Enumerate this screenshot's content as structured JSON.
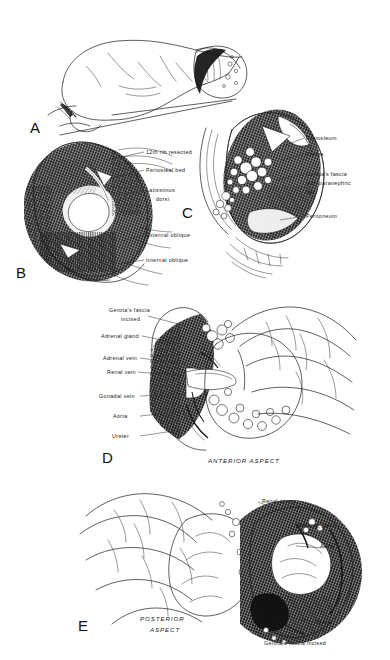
{
  "figure": {
    "ink_color": "#1a1a1a",
    "background_color": "#ffffff"
  },
  "panels": [
    {
      "letter": "A",
      "name": "patient-positioning",
      "caption": "",
      "labels": []
    },
    {
      "letter": "B",
      "name": "superficial-muscle-layers",
      "caption": "",
      "labels": [
        {
          "text": "12th rib resected"
        },
        {
          "text": "Periosteal bed"
        },
        {
          "text": "Latissimus"
        },
        {
          "text": "dorsi"
        },
        {
          "text": "External oblique"
        },
        {
          "text": "Internal oblique"
        }
      ]
    },
    {
      "letter": "C",
      "name": "deep-retroperitoneal-exposure",
      "caption": "",
      "labels": [
        {
          "text": "Periosteum"
        },
        {
          "text": "Pleura"
        },
        {
          "text": "Gerota's fascia"
        },
        {
          "text": "with paranephric"
        },
        {
          "text": "fat"
        },
        {
          "text": "Peritoneum"
        }
      ]
    },
    {
      "letter": "D",
      "name": "anterior-aspect-dissection",
      "caption": "ANTERIOR ASPECT",
      "labels": [
        {
          "text": "Gerota's fascia"
        },
        {
          "text": "incised"
        },
        {
          "text": "Adrenal gland"
        },
        {
          "text": "Adrenal vein"
        },
        {
          "text": "Renal vein"
        },
        {
          "text": "Gonadal vein"
        },
        {
          "text": "Aorta"
        },
        {
          "text": "Ureter"
        }
      ]
    },
    {
      "letter": "E",
      "name": "posterior-aspect-dissection",
      "caption": "POSTERIOR ASPECT",
      "labels": [
        {
          "text": "Renal artery"
        },
        {
          "text": "Adrenal gland"
        },
        {
          "text": "Aorta"
        },
        {
          "text": "Ureter"
        },
        {
          "text": "Gerota's fascia incised"
        }
      ]
    }
  ]
}
